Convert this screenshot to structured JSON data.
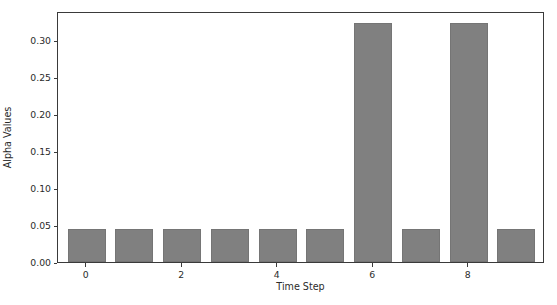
{
  "chart_data": {
    "type": "bar",
    "title": "",
    "xlabel": "Time Step",
    "ylabel": "Alpha Values",
    "categories": [
      0,
      1,
      2,
      3,
      4,
      5,
      6,
      7,
      8,
      9
    ],
    "values": [
      0.044,
      0.044,
      0.044,
      0.044,
      0.044,
      0.044,
      0.323,
      0.044,
      0.323,
      0.044
    ],
    "xlim": [
      -0.6,
      9.6
    ],
    "ylim": [
      0.0,
      0.3394
    ],
    "xticks": [
      0,
      2,
      4,
      6,
      8
    ],
    "xticklabels": [
      "0",
      "2",
      "4",
      "6",
      "8"
    ],
    "yticks": [
      0.0,
      0.05,
      0.1,
      0.15,
      0.2,
      0.25,
      0.3
    ],
    "yticklabels": [
      "0.00",
      "0.05",
      "0.10",
      "0.15",
      "0.20",
      "0.25",
      "0.30"
    ],
    "grid": false,
    "legend": null,
    "bar_color": "#808080",
    "bar_edge_color": "#757575",
    "bar_width": 0.8,
    "axes_edge_color": "#3a3a3a",
    "background_color": "#ffffff"
  }
}
